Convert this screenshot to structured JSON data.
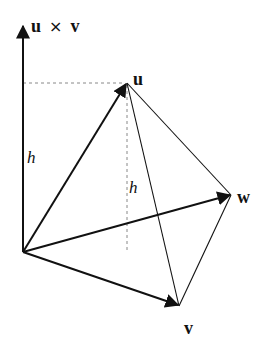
{
  "diagram": {
    "labels": {
      "cross_product_u": "u",
      "cross_product_op": "×",
      "cross_product_v": "v",
      "u": "u",
      "v": "v",
      "w": "w",
      "height_axis": "h",
      "height_dashed": "h"
    },
    "points": {
      "origin": [
        23,
        252
      ],
      "axis_tip": [
        23,
        26
      ],
      "u": [
        127,
        83
      ],
      "v": [
        179,
        306
      ],
      "w": [
        231,
        195
      ],
      "dashed_foot": [
        127,
        250
      ]
    },
    "colors": {
      "stroke": "#111111",
      "dashed": "#888888",
      "background": "#ffffff"
    }
  }
}
